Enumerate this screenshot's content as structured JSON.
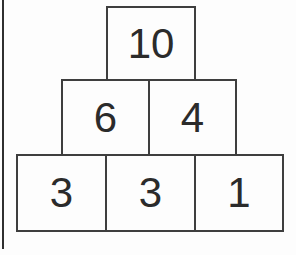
{
  "figure": {
    "type": "number-pyramid",
    "rows": [
      {
        "cells": [
          {
            "value": "10"
          }
        ]
      },
      {
        "cells": [
          {
            "value": "6"
          },
          {
            "value": "4"
          }
        ]
      },
      {
        "cells": [
          {
            "value": "3"
          },
          {
            "value": "3"
          },
          {
            "value": "1"
          }
        ]
      }
    ]
  },
  "colors": {
    "background": "#fdfdfd",
    "cell_border": "#3e3e3e",
    "digit_text": "#2b2b2b",
    "page_edge_line": "#2f2f2f"
  }
}
